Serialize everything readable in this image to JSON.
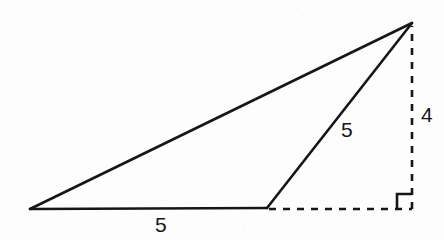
{
  "figure": {
    "kind": "geometry-diagram",
    "canvas": {
      "width": 444,
      "height": 240
    },
    "colors": {
      "background": "#fdfdfd",
      "stroke": "#16161a",
      "label": "#16161a"
    },
    "stroke_width": 2.6,
    "dash_pattern": "7 7",
    "vertices": {
      "left": {
        "name": "left-vertex",
        "x": 30,
        "y": 209
      },
      "base_right": {
        "name": "base-right-vertex",
        "x": 267,
        "y": 208
      },
      "apex": {
        "name": "apex-vertex",
        "x": 412,
        "y": 23
      },
      "foot": {
        "name": "altitude-foot",
        "x": 412,
        "y": 209
      }
    },
    "solid_edges": [
      {
        "name": "hypotenuse-edge",
        "from": "left",
        "to": "apex"
      },
      {
        "name": "base-edge",
        "from": "left",
        "to": "base_right"
      },
      {
        "name": "slant-edge",
        "from": "base_right",
        "to": "apex"
      }
    ],
    "dashed_edges": [
      {
        "name": "base-extension-edge",
        "from": "base_right",
        "to": "foot"
      },
      {
        "name": "altitude-edge",
        "from": "foot",
        "to": "apex"
      }
    ],
    "right_angle_mark": {
      "name": "right-angle-marker",
      "at": "foot",
      "size": 15,
      "direction": "up-left"
    },
    "labels": [
      {
        "name": "base-length-label",
        "text": "5",
        "x": 155,
        "y": 214
      },
      {
        "name": "slant-length-label",
        "text": "5",
        "x": 341,
        "y": 119
      },
      {
        "name": "altitude-length-label",
        "text": "4",
        "x": 421,
        "y": 104
      }
    ]
  }
}
